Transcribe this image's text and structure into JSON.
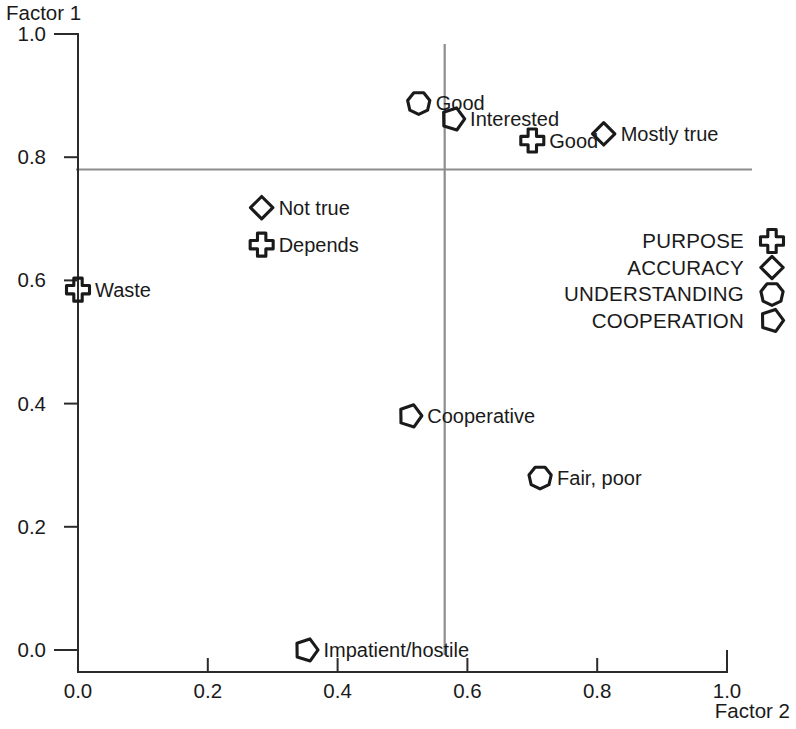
{
  "chart_data": {
    "type": "scatter",
    "title": "",
    "xlabel": "Factor 2",
    "ylabel": "Factor 1",
    "xlim": [
      0.0,
      1.0
    ],
    "ylim": [
      0.0,
      1.0
    ],
    "grid": false,
    "x_ticks": [
      "0.0",
      "0.2",
      "0.4",
      "0.6",
      "0.8",
      "1.0"
    ],
    "x_tick_values": [
      0.0,
      0.2,
      0.4,
      0.6,
      0.8,
      1.0
    ],
    "y_ticks": [
      "0.0",
      "0.2",
      "0.4",
      "0.6",
      "0.8",
      "1.0"
    ],
    "y_tick_values": [
      0.0,
      0.2,
      0.4,
      0.6,
      0.8,
      1.0
    ],
    "reference_lines": [
      {
        "orientation": "vertical",
        "value": 0.565
      },
      {
        "orientation": "horizontal",
        "value": 0.78
      }
    ],
    "legend_position": "right",
    "legend": [
      {
        "name": "PURPOSE",
        "marker": "cross"
      },
      {
        "name": "ACCURACY",
        "marker": "diamond"
      },
      {
        "name": "UNDERSTANDING",
        "marker": "hexagon"
      },
      {
        "name": "COOPERATION",
        "marker": "pentagon"
      }
    ],
    "points": [
      {
        "label": "Good",
        "x": 0.525,
        "y": 0.888,
        "marker": "hexagon",
        "series": "UNDERSTANDING"
      },
      {
        "label": "Interested",
        "x": 0.578,
        "y": 0.862,
        "marker": "pentagon",
        "series": "COOPERATION"
      },
      {
        "label": "Good",
        "x": 0.7,
        "y": 0.827,
        "marker": "cross",
        "series": "PURPOSE"
      },
      {
        "label": "Mostly true",
        "x": 0.81,
        "y": 0.838,
        "marker": "diamond",
        "series": "ACCURACY"
      },
      {
        "label": "Not  true",
        "x": 0.283,
        "y": 0.718,
        "marker": "diamond",
        "series": "ACCURACY"
      },
      {
        "label": "Depends",
        "x": 0.283,
        "y": 0.658,
        "marker": "cross",
        "series": "PURPOSE"
      },
      {
        "label": "Waste",
        "x": 0.0,
        "y": 0.585,
        "marker": "cross",
        "series": "PURPOSE"
      },
      {
        "label": "Cooperative",
        "x": 0.512,
        "y": 0.38,
        "marker": "pentagon",
        "series": "COOPERATION"
      },
      {
        "label": "Fair, poor",
        "x": 0.712,
        "y": 0.28,
        "marker": "hexagon",
        "series": "UNDERSTANDING"
      },
      {
        "label": "Impatient/hostile",
        "x": 0.352,
        "y": 0.0,
        "marker": "pentagon",
        "series": "COOPERATION"
      }
    ]
  }
}
